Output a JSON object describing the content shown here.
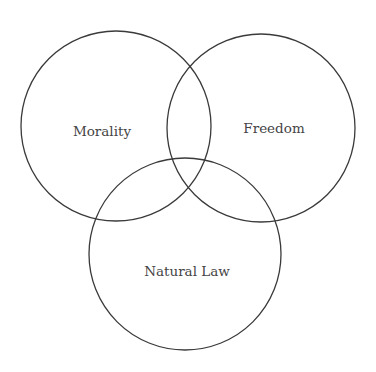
{
  "diagram": {
    "type": "venn",
    "background": "#ffffff",
    "stroke_color": "#3a3a3a",
    "label_color": "#444444",
    "sets": [
      {
        "label": "Morality",
        "cx": 116,
        "cy": 126,
        "r": 95,
        "label_x": 102,
        "label_y": 136
      },
      {
        "label": "Freedom",
        "cx": 261,
        "cy": 128,
        "r": 94,
        "label_x": 274,
        "label_y": 133
      },
      {
        "label": "Natural Law",
        "cx": 185,
        "cy": 254,
        "r": 96,
        "label_x": 187,
        "label_y": 276
      }
    ]
  }
}
